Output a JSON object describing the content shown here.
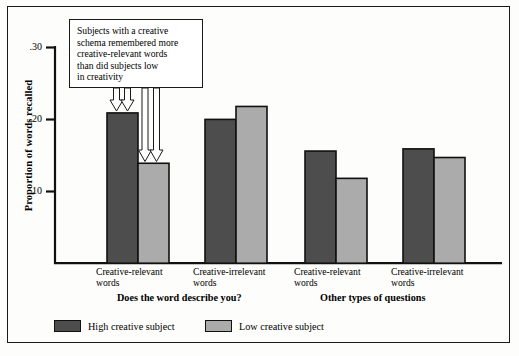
{
  "chart_data": {
    "type": "bar",
    "title": "",
    "subtitle": "",
    "xlabel": "",
    "ylabel": "Proportion of words recalled",
    "ylim": [
      0,
      0.3
    ],
    "yticks": [
      ".10",
      ".20",
      ".30"
    ],
    "ytick_values": [
      0.1,
      0.2,
      0.3
    ],
    "grid": false,
    "legend_position": "bottom-left",
    "categories": [
      "Creative-relevant words",
      "Creative-irrelevant words",
      "Creative-relevant words",
      "Creative-irrelevant words"
    ],
    "group_labels": [
      "Does the word describe you?",
      "Other types of questions"
    ],
    "series": [
      {
        "name": "High creative subject",
        "color": "#4d4d4d",
        "values": [
          0.209,
          0.2,
          0.156,
          0.159
        ]
      },
      {
        "name": "Low creative subject",
        "color": "#ababab",
        "values": [
          0.139,
          0.218,
          0.118,
          0.147
        ]
      }
    ],
    "annotations": [
      {
        "text": "Subjects with a creative schema remembered more creative-relevant words than did subjects low in creativity",
        "lines": [
          "Subjects with a creative",
          "schema remembered more",
          "creative-relevant words",
          "than did subjects low",
          "in creativity"
        ],
        "points_to": [
          "Creative-relevant words / High creative subject",
          "Creative-relevant words / Low creative subject"
        ]
      }
    ]
  },
  "axis": {
    "ytick_1": ".10",
    "ytick_2": ".20",
    "ytick_3": ".30",
    "ylabel": "Proportion of words recalled"
  },
  "callout": {
    "line1": "Subjects with a creative",
    "line2": "schema remembered more",
    "line3": "creative-relevant words",
    "line4": "than did subjects low",
    "line5": "in creativity"
  },
  "categories": {
    "c1_line1": "Creative-relevant",
    "c1_line2": "words",
    "c2_line1": "Creative-irrelevant",
    "c2_line2": "words",
    "c3_line1": "Creative-relevant",
    "c3_line2": "words",
    "c4_line1": "Creative-irrelevant",
    "c4_line2": "words"
  },
  "groups": {
    "left": "Does the word describe you?",
    "right": "Other types of questions"
  },
  "legend": {
    "high_label": "High creative subject",
    "low_label": "Low creative subject",
    "high_color": "#4d4d4d",
    "low_color": "#ababab"
  }
}
